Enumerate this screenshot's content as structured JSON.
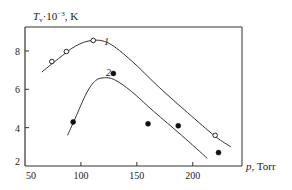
{
  "chart_data": {
    "type": "line",
    "title": "",
    "xlabel": "p, Torr",
    "ylabel": "T_v·10^-3, K",
    "xlim": [
      50,
      244
    ],
    "ylim": [
      2,
      9.25
    ],
    "xticks": [
      50,
      100,
      150,
      200
    ],
    "yticks": [
      2,
      4,
      6,
      8
    ],
    "grid": false,
    "legend": "inline curve labels",
    "series": [
      {
        "name": "1",
        "marker": "open-circle",
        "points": [
          [
            74,
            7.45
          ],
          [
            87,
            7.97
          ],
          [
            111,
            8.55
          ],
          [
            220,
            3.6
          ]
        ],
        "curve": [
          [
            65,
            6.9
          ],
          [
            80,
            7.6
          ],
          [
            95,
            8.25
          ],
          [
            110,
            8.55
          ],
          [
            125,
            8.4
          ],
          [
            145,
            7.5
          ],
          [
            170,
            6.1
          ],
          [
            195,
            4.8
          ],
          [
            220,
            3.55
          ],
          [
            234,
            3.0
          ]
        ]
      },
      {
        "name": "2",
        "marker": "filled-circle",
        "points": [
          [
            93,
            4.3
          ],
          [
            129,
            6.83
          ],
          [
            160,
            4.2
          ],
          [
            187,
            4.1
          ],
          [
            223,
            2.7
          ]
        ],
        "curve": [
          [
            88,
            3.6
          ],
          [
            95,
            4.5
          ],
          [
            105,
            5.8
          ],
          [
            113,
            6.45
          ],
          [
            121,
            6.6
          ],
          [
            130,
            6.5
          ],
          [
            145,
            5.9
          ],
          [
            165,
            4.85
          ],
          [
            190,
            3.6
          ],
          [
            213,
            2.4
          ]
        ]
      }
    ]
  },
  "axes": {
    "y_title_main": "T",
    "y_title_sub": "v",
    "y_title_rest": "·10",
    "y_title_exp": "−3",
    "y_title_unit": ", K",
    "x_title_var": "p",
    "x_title_unit": ", Torr",
    "x_tick_labels": [
      "50",
      "100",
      "150",
      "200"
    ],
    "y_tick_labels": [
      "2",
      "4",
      "6",
      "8"
    ]
  },
  "labels": {
    "curve1": "1",
    "curve2": "2"
  }
}
